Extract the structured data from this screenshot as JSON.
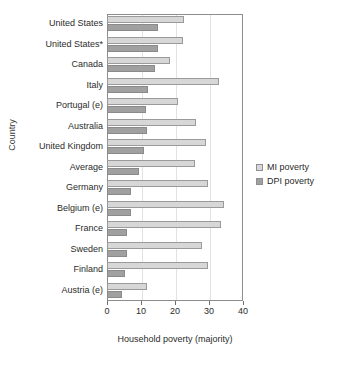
{
  "chart_data": {
    "type": "bar",
    "orientation": "horizontal",
    "title": "",
    "xlabel": "Household poverty (majority)",
    "ylabel": "Country",
    "xlim": [
      0,
      40
    ],
    "xticks": [
      0,
      10,
      20,
      30,
      40
    ],
    "grid": false,
    "legend_position": "right",
    "categories": [
      "United States",
      "United States*",
      "Canada",
      "Italy",
      "Portugal (e)",
      "Australia",
      "United Kingdom",
      "Average",
      "Germany",
      "Belgium (e)",
      "France",
      "Sweden",
      "Finland",
      "Austria (e)"
    ],
    "series": [
      {
        "name": "MI poverty",
        "color": "#d7d7d7",
        "values": [
          22.5,
          22.4,
          18.4,
          33.0,
          20.8,
          26.2,
          29.2,
          25.8,
          29.6,
          34.5,
          33.5,
          27.8,
          29.6,
          11.8
        ]
      },
      {
        "name": "DPI poverty",
        "color": "#a0a0a0",
        "values": [
          15.0,
          15.0,
          14.0,
          12.2,
          11.6,
          11.9,
          11.0,
          9.4,
          7.2,
          7.0,
          6.0,
          5.8,
          5.4,
          4.5
        ]
      }
    ]
  },
  "legend": {
    "items": [
      {
        "label": "MI poverty",
        "swatch": "legend-swatch-mi"
      },
      {
        "label": "DPI poverty",
        "swatch": "legend-swatch-dpi"
      }
    ]
  }
}
